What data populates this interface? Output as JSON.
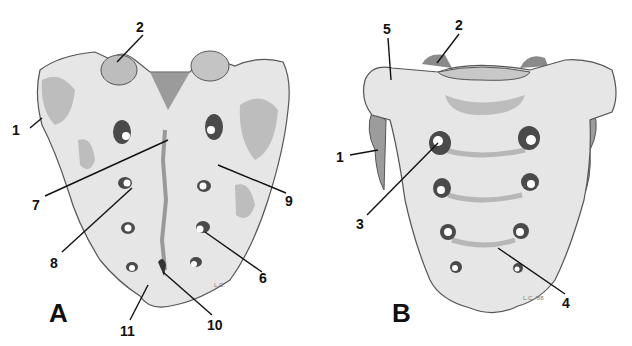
{
  "figure": {
    "panels": [
      {
        "id": "A",
        "label": "A",
        "callouts": [
          {
            "number": "1",
            "x": 18,
            "y": 132
          },
          {
            "number": "2",
            "x": 140,
            "y": 30
          },
          {
            "number": "7",
            "x": 38,
            "y": 207
          },
          {
            "number": "8",
            "x": 55,
            "y": 265
          },
          {
            "number": "9",
            "x": 290,
            "y": 203
          },
          {
            "number": "6",
            "x": 265,
            "y": 280
          },
          {
            "number": "10",
            "x": 218,
            "y": 327
          },
          {
            "number": "11",
            "x": 124,
            "y": 333
          }
        ]
      },
      {
        "id": "B",
        "label": "B",
        "callouts": [
          {
            "number": "5",
            "x": 387,
            "y": 32
          },
          {
            "number": "2",
            "x": 457,
            "y": 28
          },
          {
            "number": "1",
            "x": 338,
            "y": 160
          },
          {
            "number": "3",
            "x": 360,
            "y": 227
          },
          {
            "number": "4",
            "x": 565,
            "y": 305
          }
        ]
      }
    ],
    "signature_A": "L.C.",
    "signature_B": "L.C. '88"
  }
}
